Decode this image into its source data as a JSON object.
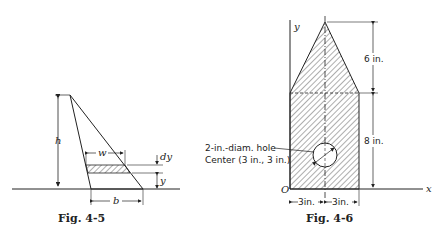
{
  "figures": [
    {
      "id": "fig-4-5",
      "caption": "Fig. 4-5",
      "labels": {
        "h": "h",
        "w": "w",
        "b": "b",
        "dy": "dy",
        "y": "y"
      }
    },
    {
      "id": "fig-4-6",
      "caption": "Fig. 4-6",
      "labels": {
        "y_axis": "y",
        "x_axis": "x",
        "origin": "O",
        "top_height": "6 in.",
        "bottom_height": "8 in.",
        "hole_desc": "2-in.-diam. hole",
        "hole_center": "Center (3 in., 3 in.)",
        "left_width": "3in.",
        "right_width": "3in."
      }
    }
  ]
}
